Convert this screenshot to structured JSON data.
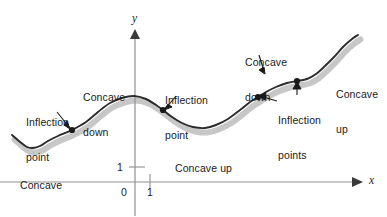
{
  "figure": {
    "background_color": "#ffffff",
    "curve_color": "#2b2b2b",
    "shadow_color": "#b8b8b8",
    "axis_color": "#8a8a8a",
    "dot_color": "#1a1a1a",
    "leader_color": "#1a1a1a"
  },
  "axes": {
    "x_label": "x",
    "y_label": "y",
    "origin_label": "0",
    "x_tick_label": "1",
    "y_tick_label": "1",
    "x_axis_y_px": 182,
    "y_axis_x_px": 135,
    "unit_px": 15
  },
  "annotations": [
    {
      "id": "inflection-point-left",
      "text": "Inflection\npoint",
      "line1": "Inflection",
      "line2": "point",
      "x": 26,
      "y": 94
    },
    {
      "id": "concave-up-left",
      "text": "Concave\nup",
      "line1": "Concave",
      "line2": "up",
      "x": 20,
      "y": 157
    },
    {
      "id": "concave-down-left",
      "text": "Concave\ndown",
      "line1": "Concave",
      "line2": "down",
      "x": 83,
      "y": 69
    },
    {
      "id": "inflection-point-mid",
      "text": "Inflection\npoint",
      "line1": "Inflection",
      "line2": "point",
      "x": 165,
      "y": 72
    },
    {
      "id": "concave-up-mid",
      "text": "Concave up",
      "line1": "Concave up",
      "line2": "",
      "x": 175,
      "y": 140
    },
    {
      "id": "concave-down-right",
      "text": "Concave\ndown",
      "line1": "Concave",
      "line2": "down",
      "x": 245,
      "y": 34
    },
    {
      "id": "inflection-points-right",
      "text": "Inflection\npoints",
      "line1": "Inflection",
      "line2": "points",
      "x": 278,
      "y": 92
    },
    {
      "id": "concave-up-right",
      "text": "Concave\nup",
      "line1": "Concave",
      "line2": "up",
      "x": 336,
      "y": 66
    }
  ],
  "chart_data": {
    "type": "line",
    "xlabel": "x",
    "ylabel": "y",
    "grid": false,
    "legend": null,
    "axis_origin_px": [
      135,
      182
    ],
    "unit_px": 15,
    "xlim_px": [
      12,
      358
    ],
    "curve_points_px": [
      [
        12,
        135
      ],
      [
        20,
        142
      ],
      [
        27,
        147
      ],
      [
        33,
        148
      ],
      [
        40,
        146
      ],
      [
        48,
        141
      ],
      [
        58,
        136
      ],
      [
        72,
        130
      ],
      [
        86,
        122
      ],
      [
        98,
        112
      ],
      [
        110,
        103
      ],
      [
        122,
        98
      ],
      [
        134,
        96
      ],
      [
        146,
        99
      ],
      [
        156,
        105
      ],
      [
        163,
        110
      ],
      [
        172,
        117
      ],
      [
        182,
        123
      ],
      [
        193,
        127
      ],
      [
        205,
        128
      ],
      [
        216,
        125
      ],
      [
        228,
        119
      ],
      [
        240,
        110
      ],
      [
        250,
        102
      ],
      [
        258,
        97
      ],
      [
        266,
        92
      ],
      [
        276,
        87
      ],
      [
        287,
        83
      ],
      [
        297,
        81
      ],
      [
        307,
        79
      ],
      [
        316,
        74
      ],
      [
        325,
        66
      ],
      [
        334,
        57
      ],
      [
        343,
        47
      ],
      [
        352,
        39
      ],
      [
        358,
        35
      ]
    ],
    "inflection_points_px": [
      [
        72,
        130
      ],
      [
        163,
        110
      ],
      [
        258,
        97
      ],
      [
        297,
        81
      ]
    ],
    "concavity_regions": [
      {
        "label": "Concave up",
        "from_px": 12,
        "to_px": 72
      },
      {
        "label": "Concave down",
        "from_px": 72,
        "to_px": 163
      },
      {
        "label": "Concave up",
        "from_px": 163,
        "to_px": 258
      },
      {
        "label": "Concave down",
        "from_px": 258,
        "to_px": 297
      },
      {
        "label": "Concave up",
        "from_px": 297,
        "to_px": 358
      }
    ],
    "inflection_count": 4
  }
}
